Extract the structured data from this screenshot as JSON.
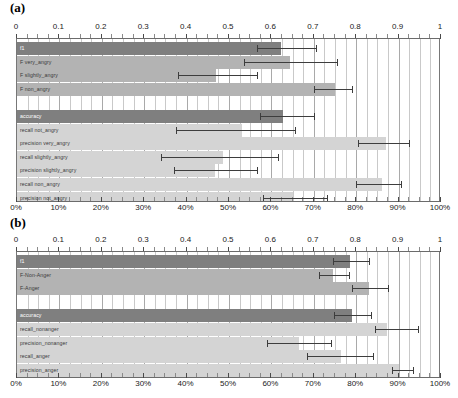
{
  "figure": {
    "panels": [
      {
        "id": "a",
        "label": "(a)",
        "top_axis": {
          "ticks": [
            "0",
            "0.1",
            "0.2",
            "0.3",
            "0.4",
            "0.5",
            "0.6",
            "0.7",
            "0.8",
            "0.9",
            "1"
          ]
        },
        "bottom_axis": {
          "ticks": [
            "0%",
            "10%",
            "20%",
            "30%",
            "40%",
            "50%",
            "60%",
            "70%",
            "80%",
            "90%",
            "100%"
          ]
        }
      },
      {
        "id": "b",
        "label": "(b)",
        "top_axis": {
          "ticks": [
            "0",
            "0.1",
            "0.2",
            "0.3",
            "0.4",
            "0.5",
            "0.6",
            "0.7",
            "0.8",
            "0.9",
            "1"
          ]
        },
        "bottom_axis": {
          "ticks": [
            "0%",
            "10%",
            "20%",
            "30%",
            "40%",
            "50%",
            "60%",
            "70%",
            "80%",
            "90%",
            "100%"
          ]
        }
      }
    ]
  },
  "colors": {
    "bar_dark": "#7f7f7f",
    "bar_mid": "#b3b3b3",
    "bar_light": "#d4d4d4",
    "error_bar": "#3d3d3d",
    "grid": "#c9c9c9",
    "axis": "#777777",
    "background": "#ffffff"
  },
  "chart_data": [
    {
      "type": "bar",
      "orientation": "horizontal",
      "panel": "a",
      "title": "(a)",
      "xlabel": "",
      "ylabel": "",
      "xlim": [
        0,
        1
      ],
      "grid": true,
      "legend": "none",
      "top_axis_ticks": [
        0,
        0.1,
        0.2,
        0.3,
        0.4,
        0.5,
        0.6,
        0.7,
        0.8,
        0.9,
        1
      ],
      "bottom_axis_ticks": [
        "0%",
        "10%",
        "20%",
        "30%",
        "40%",
        "50%",
        "60%",
        "70%",
        "80%",
        "90%",
        "100%"
      ],
      "categories": [
        "f1",
        "F very_angry",
        "F slightly_angry",
        "F non_angry",
        "",
        "accuracy",
        "recall not_angry",
        "precision very_angry",
        "recall slightly_angry",
        "precision slightly_angry",
        "recall non_angry",
        "precision not_angry"
      ],
      "values": [
        0.623,
        0.645,
        0.47,
        0.75,
        null,
        0.628,
        0.53,
        0.87,
        0.487,
        0.468,
        0.86,
        0.652
      ],
      "error_low": [
        0.565,
        0.535,
        0.38,
        0.7,
        null,
        0.572,
        0.375,
        0.805,
        0.34,
        0.37,
        0.8,
        0.58
      ],
      "error_high": [
        0.705,
        0.755,
        0.565,
        0.79,
        null,
        0.7,
        0.655,
        0.925,
        0.615,
        0.565,
        0.905,
        0.73
      ],
      "bar_shades": [
        "dark",
        "mid",
        "mid",
        "mid",
        null,
        "dark",
        "light",
        "light",
        "light",
        "light",
        "light",
        "light"
      ]
    },
    {
      "type": "bar",
      "orientation": "horizontal",
      "panel": "b",
      "title": "(b)",
      "xlabel": "",
      "ylabel": "",
      "xlim": [
        0,
        1
      ],
      "grid": true,
      "legend": "none",
      "top_axis_ticks": [
        0,
        0.1,
        0.2,
        0.3,
        0.4,
        0.5,
        0.6,
        0.7,
        0.8,
        0.9,
        1
      ],
      "bottom_axis_ticks": [
        "0%",
        "10%",
        "20%",
        "30%",
        "40%",
        "50%",
        "60%",
        "70%",
        "80%",
        "90%",
        "100%"
      ],
      "categories": [
        "f1",
        "F-Non-Anger",
        "F-Anger",
        "",
        "accuracy",
        "recall_nonanger",
        "precision_nonanger",
        "recall_anger",
        "precision_anger"
      ],
      "values": [
        0.785,
        0.745,
        0.83,
        null,
        0.79,
        0.872,
        0.665,
        0.765,
        0.9
      ],
      "error_low": [
        0.745,
        0.712,
        0.79,
        null,
        0.748,
        0.845,
        0.59,
        0.685,
        0.885
      ],
      "error_high": [
        0.83,
        0.782,
        0.875,
        null,
        0.835,
        0.945,
        0.74,
        0.84,
        0.935
      ],
      "bar_shades": [
        "dark",
        "mid",
        "mid",
        null,
        "dark",
        "light",
        "light",
        "light",
        "light"
      ]
    }
  ]
}
